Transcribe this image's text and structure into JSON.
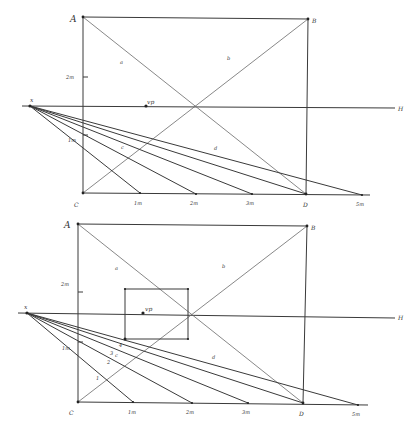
{
  "diagrams": [
    {
      "id": "top",
      "labels": {
        "A": "A",
        "B": "B",
        "C": "C",
        "D": "D",
        "vp": "vp",
        "x": "x",
        "h": "H",
        "a": "a",
        "b": "b",
        "c": "c",
        "d": "d",
        "height_mark": "2m",
        "side_mark": "1m",
        "base_ticks": [
          "1m",
          "2m",
          "3m",
          "5m"
        ]
      }
    },
    {
      "id": "bottom",
      "labels": {
        "A": "A",
        "B": "B",
        "C": "C",
        "D": "D",
        "vp": "vp",
        "x": "x",
        "h": "H",
        "a": "a",
        "b": "b",
        "c": "c",
        "d": "d",
        "height_mark": "2m",
        "side_mark": "1m",
        "base_ticks": [
          "1m",
          "2m",
          "3m",
          "5m"
        ],
        "diag_marks": [
          "1",
          "2",
          "3",
          "4"
        ]
      }
    }
  ]
}
